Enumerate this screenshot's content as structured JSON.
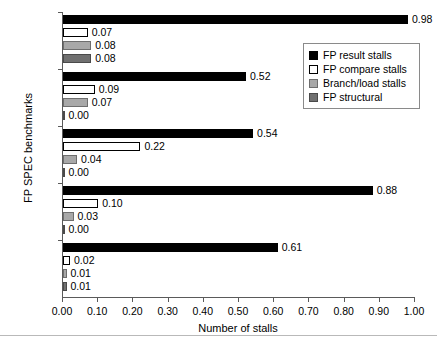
{
  "chart_data": {
    "type": "bar",
    "orientation": "horizontal",
    "title": "",
    "xlabel": "Number of stalls",
    "ylabel": "FP SPEC benchmarks",
    "xlim": [
      0.0,
      1.0
    ],
    "xticks": [
      "0.00",
      "0.10",
      "0.20",
      "0.30",
      "0.40",
      "0.50",
      "0.60",
      "0.70",
      "0.80",
      "0.90",
      "1.00"
    ],
    "grid": false,
    "legend_position": "upper right",
    "categories": [
      "doduc",
      "ear",
      "hydro2d",
      "mdljdp",
      "su2cor"
    ],
    "series": [
      {
        "name": "FP result stalls",
        "color": "#000000",
        "values": [
          0.98,
          0.52,
          0.54,
          0.88,
          0.61
        ],
        "labels": [
          "0.98",
          "0.52",
          "0.54",
          "0.88",
          "0.61"
        ]
      },
      {
        "name": "FP compare stalls",
        "color": "#ffffff",
        "values": [
          0.07,
          0.09,
          0.22,
          0.1,
          0.02
        ],
        "labels": [
          "0.07",
          "0.09",
          "0.22",
          "0.10",
          "0.02"
        ]
      },
      {
        "name": "Branch/load stalls",
        "color": "#a8a8a8",
        "values": [
          0.08,
          0.07,
          0.04,
          0.03,
          0.01
        ],
        "labels": [
          "0.08",
          "0.07",
          "0.04",
          "0.03",
          "0.01"
        ]
      },
      {
        "name": "FP structural",
        "color": "#707070",
        "values": [
          0.08,
          0.0,
          0.0,
          0.0,
          0.01
        ],
        "labels": [
          "0.08",
          "0.00",
          "0.00",
          "0.00",
          "0.01"
        ]
      }
    ]
  },
  "legend": {
    "entries": [
      {
        "label": "FP result stalls"
      },
      {
        "label": "FP compare stalls"
      },
      {
        "label": "Branch/load stalls"
      },
      {
        "label": "FP structural"
      }
    ]
  }
}
